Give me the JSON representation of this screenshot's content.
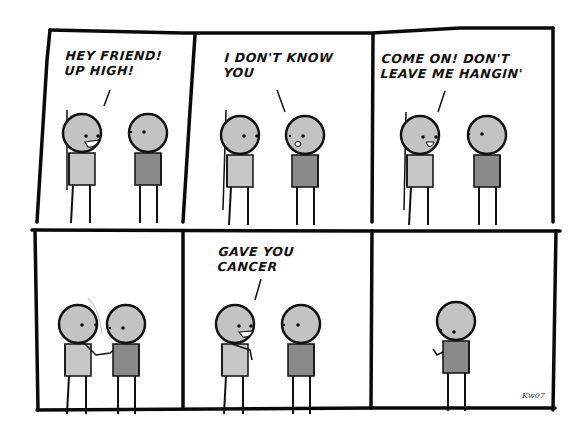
{
  "comic": {
    "panel_count": 6,
    "colors": {
      "border": "#0a0a0a",
      "head_fill": "#c3c3c3",
      "shirt_light": "#c6c6c6",
      "shirt_dark": "#8a8a8a",
      "background": "#ffffff"
    },
    "panels": [
      {
        "index": 1,
        "speech": "HEY FRIEND!\nUP HIGH!",
        "speaker": "left",
        "scene": "left character smiles at right character"
      },
      {
        "index": 2,
        "speech": "I DON'T KNOW\nYOU",
        "speaker": "right",
        "scene": "right character responds"
      },
      {
        "index": 3,
        "speech": "COME ON! DON'T\nLEAVE ME HANGIN'",
        "speaker": "left",
        "scene": "left character smiles"
      },
      {
        "index": 4,
        "speech": "",
        "speaker": "",
        "scene": "characters high-five"
      },
      {
        "index": 5,
        "speech": "GAVE YOU\nCANCER",
        "speaker": "left",
        "scene": "left character grins"
      },
      {
        "index": 6,
        "speech": "",
        "speaker": "",
        "scene": "right character alone"
      }
    ],
    "signature": "Kw07"
  }
}
